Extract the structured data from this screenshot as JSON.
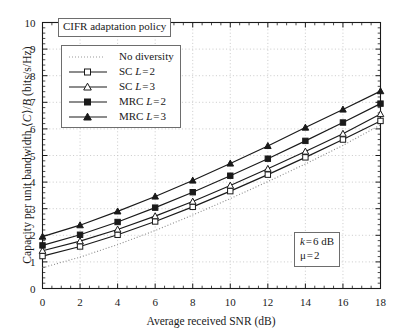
{
  "chart_data": {
    "type": "line",
    "title": "CIFR adaptation policy",
    "xlabel": "Average received SNR (dB)",
    "ylabel": "Capacity per unit bandwidth ⟨C⟩/B (bits/s/Hz)",
    "xlim": [
      0,
      18
    ],
    "ylim": [
      0,
      10
    ],
    "xticks": [
      0,
      2,
      4,
      6,
      8,
      10,
      12,
      14,
      16,
      18
    ],
    "yticks": [
      0,
      1,
      2,
      3,
      4,
      5,
      6,
      7,
      8,
      9,
      10
    ],
    "x": [
      0,
      2,
      4,
      6,
      8,
      10,
      12,
      14,
      16,
      18
    ],
    "grid": "dotted",
    "legend_position": "upper-left",
    "series": [
      {
        "name": "No diversity",
        "style": "dotted",
        "marker": "none",
        "color": "#8a8a8a",
        "values": [
          0.78,
          1.18,
          1.65,
          2.18,
          2.76,
          3.38,
          4.02,
          4.68,
          5.38,
          6.15
        ]
      },
      {
        "name": "SC L = 2",
        "style": "solid",
        "marker": "open-square",
        "color": "#1a1a1a",
        "values": [
          1.22,
          1.58,
          2.02,
          2.52,
          3.07,
          3.66,
          4.28,
          4.93,
          5.6,
          6.3
        ]
      },
      {
        "name": "SC L = 3",
        "style": "solid",
        "marker": "open-triangle",
        "color": "#1a1a1a",
        "values": [
          1.42,
          1.78,
          2.22,
          2.72,
          3.27,
          3.87,
          4.5,
          5.15,
          5.82,
          6.56
        ]
      },
      {
        "name": "MRC L = 2",
        "style": "solid",
        "marker": "filled-square",
        "color": "#1a1a1a",
        "values": [
          1.62,
          2.02,
          2.5,
          3.04,
          3.62,
          4.24,
          4.88,
          5.55,
          6.24,
          6.95
        ]
      },
      {
        "name": "MRC L = 3",
        "style": "solid",
        "marker": "filled-triangle",
        "color": "#1a1a1a",
        "values": [
          1.95,
          2.38,
          2.9,
          3.46,
          4.06,
          4.7,
          5.36,
          6.05,
          6.73,
          7.42
        ]
      }
    ],
    "annotations": [
      {
        "line1": "k = 6 dB",
        "line2": "μ = 2"
      }
    ]
  },
  "legend": {
    "items": [
      {
        "label": "No diversity",
        "marker": "dotted-line"
      },
      {
        "label": "SC L = 2",
        "marker": "open-square"
      },
      {
        "label": "SC L = 3",
        "marker": "open-triangle"
      },
      {
        "label": "MRC L = 2",
        "marker": "filled-square"
      },
      {
        "label": "MRC L = 3",
        "marker": "filled-triangle"
      }
    ]
  },
  "annotation": {
    "k_line": "k = 6 dB",
    "mu_line": "μ = 2"
  },
  "colors": {
    "axis": "#1a1a1a",
    "grid": "#bdbdbd",
    "dotted_series": "#8a8a8a",
    "box_border": "#6d6d6d"
  }
}
